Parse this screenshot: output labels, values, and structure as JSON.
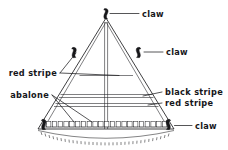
{
  "figure": {
    "background_color": "#ffffff",
    "ink_color": "#1d1d20"
  },
  "labels": {
    "claw_top": "claw",
    "claw_upper_right": "claw",
    "claw_bottom_right": "claw",
    "red_stripe_left": "red stripe",
    "abalone": "abalone",
    "black_stripe_right": "black stripe",
    "red_stripe_right": "red stripe"
  },
  "parts": [
    {
      "name": "claw",
      "position": "apex",
      "count": 1
    },
    {
      "name": "claw",
      "position": "upper-left-edge",
      "count": 1
    },
    {
      "name": "claw",
      "position": "upper-right-edge",
      "count": 1
    },
    {
      "name": "claw",
      "position": "bottom-left-corner",
      "count": 1
    },
    {
      "name": "claw",
      "position": "bottom-right-corner",
      "count": 1
    },
    {
      "name": "red stripe",
      "position": "upper-horizontal-band",
      "count": 1
    },
    {
      "name": "black stripe",
      "position": "mid-horizontal-band",
      "count": 1
    },
    {
      "name": "red stripe",
      "position": "lower-horizontal-band",
      "count": 1
    },
    {
      "name": "abalone",
      "position": "bottom-bead-row",
      "count": 22
    }
  ],
  "geometry": {
    "apex": {
      "x": 106,
      "y": 18
    },
    "base_left": {
      "x": 38,
      "y": 129
    },
    "base_right": {
      "x": 174,
      "y": 129
    },
    "bead_count": 22
  }
}
